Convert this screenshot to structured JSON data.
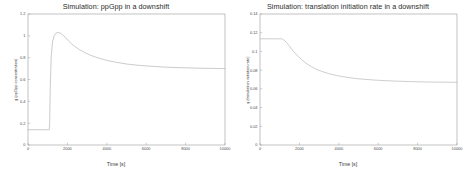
{
  "figure": {
    "background_color": "#ffffff",
    "axis_color": "#9a9a9a",
    "text_color": "#3a3a3a"
  },
  "panels": [
    {
      "panel_name": "ppgpp-panel",
      "title": "Simulation: ppGpp in a downshift",
      "xlabel": "Time [s]",
      "ylabel": "g (ppGpp concentration)",
      "xticks": [
        "0",
        "2000",
        "4000",
        "6000",
        "8000",
        "10000"
      ],
      "yticks": [
        "0",
        "0.2",
        "0.4",
        "0.6",
        "0.8",
        "1",
        "1.2"
      ],
      "curve_color": "#b9b9b9"
    },
    {
      "panel_name": "translation-rate-panel",
      "title": "Simulation: translation initiation rate in a downshift",
      "xlabel": "Time [s]",
      "ylabel": "q (translation initiation rate)",
      "xticks": [
        "0",
        "2000",
        "4000",
        "6000",
        "8000",
        "10000"
      ],
      "yticks": [
        "0",
        "0.02",
        "0.04",
        "0.06",
        "0.08",
        "0.1",
        "0.12",
        "0.14"
      ],
      "curve_color": "#bdbdbd"
    }
  ],
  "chart_data": [
    {
      "type": "line",
      "title": "Simulation: ppGpp in a downshift",
      "xlabel": "Time [s]",
      "ylabel": "g (ppGpp concentration)",
      "xlim": [
        0,
        10000
      ],
      "ylim": [
        0,
        1.2
      ],
      "xticks": [
        0,
        2000,
        4000,
        6000,
        8000,
        10000
      ],
      "yticks": [
        0,
        0.2,
        0.4,
        0.6,
        0.8,
        1.0,
        1.2
      ],
      "grid": false,
      "legend": null,
      "series": [
        {
          "name": "g (ppGpp concentration)",
          "x": [
            0,
            200,
            400,
            600,
            800,
            1000,
            1080,
            1100,
            1130,
            1180,
            1250,
            1330,
            1420,
            1520,
            1640,
            1760,
            1900,
            2050,
            2200,
            2400,
            2600,
            2900,
            3200,
            3600,
            4000,
            4500,
            5000,
            5600,
            6200,
            6800,
            7400,
            8000,
            8600,
            9200,
            9600,
            10000
          ],
          "y": [
            0.14,
            0.14,
            0.14,
            0.14,
            0.14,
            0.14,
            0.14,
            0.2,
            0.52,
            0.82,
            0.95,
            1.0,
            1.025,
            1.03,
            1.025,
            1.01,
            0.985,
            0.955,
            0.928,
            0.9,
            0.875,
            0.845,
            0.82,
            0.795,
            0.775,
            0.757,
            0.742,
            0.73,
            0.722,
            0.715,
            0.71,
            0.707,
            0.704,
            0.702,
            0.701,
            0.7
          ]
        }
      ]
    },
    {
      "type": "line",
      "title": "Simulation: translation initiation rate in a downshift",
      "xlabel": "Time [s]",
      "ylabel": "q (translation initiation rate)",
      "xlim": [
        0,
        10000
      ],
      "ylim": [
        0,
        0.14
      ],
      "xticks": [
        0,
        2000,
        4000,
        6000,
        8000,
        10000
      ],
      "yticks": [
        0,
        0.02,
        0.04,
        0.06,
        0.08,
        0.1,
        0.12,
        0.14
      ],
      "grid": false,
      "legend": null,
      "series": [
        {
          "name": "q (translation initiation rate)",
          "x": [
            0,
            200,
            400,
            600,
            800,
            1000,
            1100,
            1200,
            1350,
            1500,
            1700,
            1900,
            2100,
            2350,
            2600,
            2900,
            3200,
            3500,
            3900,
            4300,
            4800,
            5300,
            5900,
            6500,
            7100,
            7700,
            8300,
            8900,
            9500,
            10000
          ],
          "y": [
            0.1135,
            0.1135,
            0.1135,
            0.1135,
            0.1135,
            0.1135,
            0.1135,
            0.1125,
            0.1095,
            0.1055,
            0.1,
            0.0955,
            0.0915,
            0.0872,
            0.0838,
            0.0805,
            0.0782,
            0.0762,
            0.0742,
            0.0727,
            0.0712,
            0.0702,
            0.0693,
            0.0686,
            0.0681,
            0.0677,
            0.0674,
            0.0672,
            0.0671,
            0.067
          ]
        }
      ]
    }
  ]
}
